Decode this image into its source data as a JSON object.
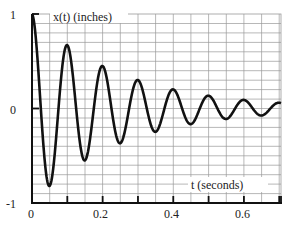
{
  "chart_data": {
    "type": "line",
    "title": "",
    "xlabel": "t (seconds)",
    "ylabel": "x(t) (inches)",
    "xlim": [
      0,
      0.705
    ],
    "ylim": [
      -1,
      1
    ],
    "x_ticks": [
      0,
      0.1,
      0.2,
      0.3,
      0.4,
      0.5,
      0.6,
      0.7
    ],
    "x_tick_labels": [
      "0",
      "",
      "0.2",
      "",
      "0.4",
      "",
      "0.6",
      ""
    ],
    "y_ticks": [
      -1,
      0,
      1
    ],
    "y_tick_labels": [
      "-1",
      "0",
      "1"
    ],
    "grid": true,
    "grid_x_step": 0.05,
    "grid_y_step": 0.1,
    "legend": null,
    "series": [
      {
        "name": "x(t)",
        "description": "damped oscillation x(t) = e^(-4t) cos(2*pi*t/0.1)",
        "decay_rate": 4.0,
        "period": 0.1,
        "initial_amplitude": 1.0,
        "key_points": [
          {
            "t": 0.0,
            "x": 1.0
          },
          {
            "t": 0.048,
            "x": -0.81
          },
          {
            "t": 0.097,
            "x": 0.68
          },
          {
            "t": 0.147,
            "x": -0.54
          },
          {
            "t": 0.195,
            "x": 0.455
          },
          {
            "t": 0.247,
            "x": -0.37
          },
          {
            "t": 0.297,
            "x": 0.31
          },
          {
            "t": 0.347,
            "x": -0.25
          },
          {
            "t": 0.397,
            "x": 0.21
          },
          {
            "t": 0.447,
            "x": -0.17
          },
          {
            "t": 0.497,
            "x": 0.14
          },
          {
            "t": 0.547,
            "x": -0.11
          },
          {
            "t": 0.597,
            "x": 0.09
          },
          {
            "t": 0.647,
            "x": -0.075
          },
          {
            "t": 0.705,
            "x": 0.06
          }
        ],
        "color": "#111111"
      }
    ]
  },
  "labels": {
    "y_axis_label": "x(t) (inches)",
    "x_axis_label": "t (seconds)",
    "y_top": "1",
    "y_mid": "0",
    "y_bottom": "-1",
    "x_0": "0",
    "x_02": "0.2",
    "x_04": "0.4",
    "x_06": "0.6"
  },
  "colors": {
    "line": "#111111",
    "axis": "#111111",
    "grid": "#9a9a9a",
    "background": "#ffffff"
  }
}
